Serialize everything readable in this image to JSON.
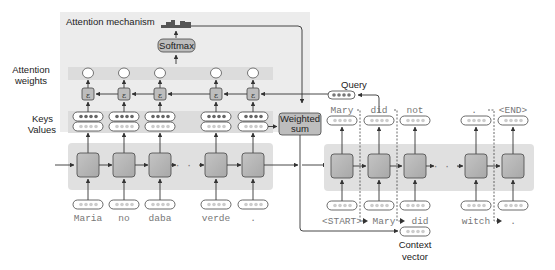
{
  "labels": {
    "attention_mechanism": "Attention mechanism",
    "attention_weights_line1": "Attention",
    "attention_weights_line2": "weights",
    "keys": "Keys",
    "values": "Values",
    "softmax": "Softmax",
    "weighted_sum_line1": "Weighted",
    "weighted_sum_line2": "sum",
    "query": "Query",
    "context_line1": "Context",
    "context_line2": "vector",
    "score_symbol": "ε"
  },
  "encoder": {
    "inputs": [
      "Maria",
      "no",
      "daba",
      "verde",
      "."
    ],
    "ellipsis": "· · ·"
  },
  "decoder": {
    "inputs": [
      "<START>",
      "Mary",
      "did",
      "witch",
      "."
    ],
    "outputs": [
      "Mary",
      "did",
      "not",
      ".",
      "<END>"
    ],
    "ellipsis": "· · ·"
  },
  "colors": {
    "panel_bg": "#ebebeb",
    "band_bg": "#dcdcdc",
    "cell_fill": "#b4b4b4",
    "cell_stroke": "#555555",
    "pill_fill": "#d4d4d4",
    "arrow": "#333333"
  }
}
